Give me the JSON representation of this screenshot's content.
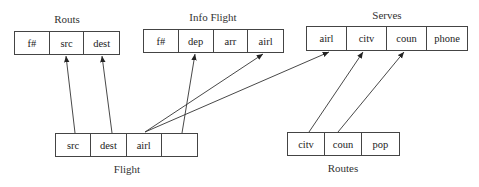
{
  "relations": [
    {
      "id": "routs",
      "title": "Routs",
      "x": 14,
      "y": 31,
      "w": 106,
      "h": 24,
      "title_x": 67,
      "title_y": 13,
      "cells": [
        "f#",
        "src",
        "dest"
      ]
    },
    {
      "id": "info-flight",
      "title": "Info Flight",
      "x": 143,
      "y": 29,
      "w": 141,
      "h": 24,
      "title_x": 213,
      "title_y": 11,
      "cells": [
        "f#",
        "dep",
        "arr",
        "airl"
      ]
    },
    {
      "id": "serves",
      "title": "Serves",
      "x": 306,
      "y": 26,
      "w": 162,
      "h": 25,
      "title_x": 387,
      "title_y": 9,
      "cells": [
        "airl",
        "citv",
        "coun",
        "phone"
      ]
    },
    {
      "id": "flight",
      "title": "Flight",
      "x": 55,
      "y": 133,
      "w": 143,
      "h": 24,
      "title_x": 127,
      "title_y": 163,
      "cells": [
        "src",
        "dest",
        "airl",
        ""
      ]
    },
    {
      "id": "routes",
      "title": "Routes",
      "x": 287,
      "y": 132,
      "w": 113,
      "h": 24,
      "title_x": 343,
      "title_y": 162,
      "cells": [
        "citv",
        "coun",
        "pop"
      ]
    }
  ],
  "arrows": [
    {
      "from": "Flight.src",
      "to": "Routs.src",
      "x1": 75,
      "y1": 133,
      "x2": 66,
      "y2": 56
    },
    {
      "from": "Flight.dest",
      "to": "Routs.dest",
      "x1": 112,
      "y1": 133,
      "x2": 102,
      "y2": 56
    },
    {
      "from": "Flight.blank",
      "to": "Info Flight.dep",
      "x1": 182,
      "y1": 133,
      "x2": 195,
      "y2": 54
    },
    {
      "from": "Flight.airl",
      "to": "Info Flight.airl",
      "x1": 145,
      "y1": 132,
      "x2": 263,
      "y2": 54
    },
    {
      "from": "Flight.airl",
      "to": "Serves.airl",
      "x1": 145,
      "y1": 132,
      "x2": 329,
      "y2": 52
    },
    {
      "from": "Routes.citv",
      "to": "Serves.citv",
      "x1": 309,
      "y1": 132,
      "x2": 363,
      "y2": 52
    },
    {
      "from": "Routes.coun",
      "to": "Serves.coun",
      "x1": 338,
      "y1": 132,
      "x2": 404,
      "y2": 52
    }
  ]
}
